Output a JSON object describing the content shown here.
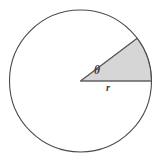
{
  "figure": {
    "kind": "circle-sector-diagram",
    "background_color": "#ffffff",
    "canvas": {
      "width": 163,
      "height": 161
    },
    "circle": {
      "name": "circle-outline",
      "center_x": 80.5,
      "center_y": 81,
      "radius": 71,
      "stroke_color": "#4a4a4a",
      "stroke_width": 1,
      "fill_color": "#ffffff"
    },
    "sector": {
      "name": "shaded-sector",
      "start_angle_deg": 0,
      "end_angle_deg": 37,
      "fill_color": "#d6d6d6",
      "stroke_color": "#6e6e6e",
      "stroke_width": 1
    },
    "labels": {
      "angle": {
        "name": "theta-label",
        "text": "θ",
        "x": 99,
        "y": 72,
        "color": "#3b3b3b"
      },
      "radius": {
        "name": "radius-label",
        "text": "r",
        "x": 110,
        "y": 89,
        "color": "#3b3b3b"
      }
    }
  }
}
